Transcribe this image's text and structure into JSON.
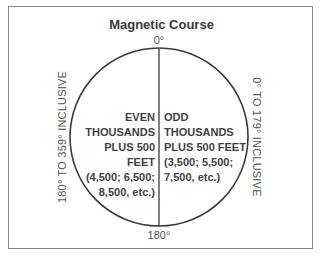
{
  "title": "Magnetic Course",
  "degrees": {
    "top": "0°",
    "bottom": "180°"
  },
  "side_labels": {
    "left": "180° TO 359° INCLUSIVE",
    "right": "0° TO 179° INCLUSIVE"
  },
  "left_half": {
    "lines": [
      "EVEN",
      "THOUSANDS",
      "PLUS 500",
      "FEET",
      "(4,500; 6,500;",
      "8,500, etc.)"
    ]
  },
  "right_half": {
    "lines": [
      "ODD",
      "THOUSANDS",
      "PLUS 500 FEET",
      "(3,500; 5,500;",
      "7,500, etc.)"
    ]
  },
  "colors": {
    "stroke": "#3a3a3a",
    "frame": "#8a8a8a",
    "text": "#3f3f3f"
  }
}
